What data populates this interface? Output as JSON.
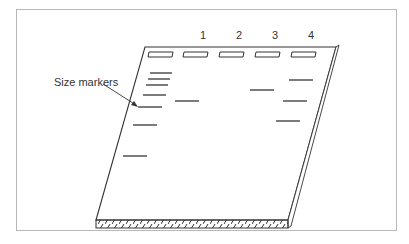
{
  "figure": {
    "type": "gel-electrophoresis-diagram",
    "callout_label": "Size markers",
    "lanes": [
      {
        "label": "",
        "name": "markers",
        "well_x": 160,
        "bands": [
          {
            "x1": 150,
            "x2": 172,
            "y": 73
          },
          {
            "x1": 148,
            "x2": 170,
            "y": 79
          },
          {
            "x1": 146,
            "x2": 168,
            "y": 85
          },
          {
            "x1": 143,
            "x2": 166,
            "y": 95
          },
          {
            "x1": 138,
            "x2": 162,
            "y": 107
          },
          {
            "x1": 133,
            "x2": 157,
            "y": 125
          },
          {
            "x1": 123,
            "x2": 147,
            "y": 156
          }
        ]
      },
      {
        "label": "1",
        "name": "lane-1",
        "well_x": 195,
        "bands": [
          {
            "x1": 175,
            "x2": 199,
            "y": 101
          }
        ]
      },
      {
        "label": "2",
        "name": "lane-2",
        "well_x": 231,
        "bands": []
      },
      {
        "label": "3",
        "name": "lane-3",
        "well_x": 267,
        "bands": [
          {
            "x1": 250,
            "x2": 274,
            "y": 90
          }
        ]
      },
      {
        "label": "4",
        "name": "lane-4",
        "well_x": 303,
        "bands": [
          {
            "x1": 289,
            "x2": 313,
            "y": 80
          },
          {
            "x1": 283,
            "x2": 307,
            "y": 101
          },
          {
            "x1": 276,
            "x2": 300,
            "y": 121
          }
        ]
      }
    ],
    "colors": {
      "line": "#333333",
      "frame": "#b8b8b8",
      "band": "#444444"
    }
  }
}
